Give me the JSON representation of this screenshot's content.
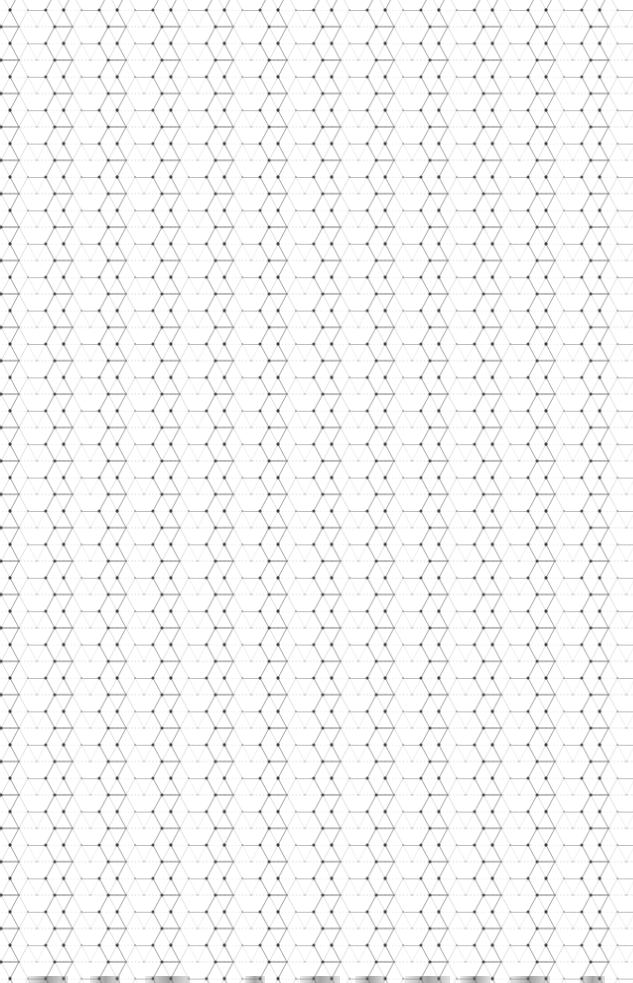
{
  "canvas": {
    "width": 633,
    "height": 983,
    "background": "#ffffff"
  },
  "pattern": {
    "type": "isometric-hexagonal-grid",
    "line_color": "#8a8a8a",
    "light_line_color": "#cfcfcf",
    "dot_color": "#3a3a3a",
    "light_dot_color": "#9a9a9a",
    "cell_width": 53.6,
    "row_height": 16.7,
    "origin_x": 10,
    "origin_y": 10
  },
  "bottom_strip": {
    "bars": [
      {
        "x": 28,
        "w": 40
      },
      {
        "x": 90,
        "w": 30
      },
      {
        "x": 145,
        "w": 45
      },
      {
        "x": 245,
        "w": 20
      },
      {
        "x": 300,
        "w": 40
      },
      {
        "x": 355,
        "w": 30
      },
      {
        "x": 405,
        "w": 45
      },
      {
        "x": 460,
        "w": 30
      },
      {
        "x": 510,
        "w": 40
      },
      {
        "x": 580,
        "w": 25
      }
    ]
  }
}
